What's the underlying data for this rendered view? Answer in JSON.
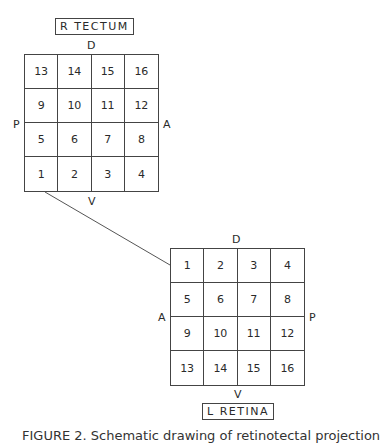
{
  "tectum": {
    "title": "R TECTUM",
    "axes": {
      "top": "D",
      "bottom": "V",
      "left": "P",
      "right": "A"
    },
    "cells": [
      [
        "13",
        "14",
        "15",
        "16"
      ],
      [
        "9",
        "10",
        "11",
        "12"
      ],
      [
        "5",
        "6",
        "7",
        "8"
      ],
      [
        "1",
        "2",
        "3",
        "4"
      ]
    ]
  },
  "retina": {
    "title": "L RETINA",
    "axes": {
      "top": "D",
      "bottom": "V",
      "left": "A",
      "right": "P"
    },
    "cells": [
      [
        "1",
        "2",
        "3",
        "4"
      ],
      [
        "5",
        "6",
        "7",
        "8"
      ],
      [
        "9",
        "10",
        "11",
        "12"
      ],
      [
        "13",
        "14",
        "15",
        "16"
      ]
    ]
  },
  "connector": {
    "from": "tectum cell 1 (bottom-left corner)",
    "to": "retina cell 1 (left edge)"
  },
  "caption": "FIGURE 2. Schematic drawing of retinotectal projection"
}
